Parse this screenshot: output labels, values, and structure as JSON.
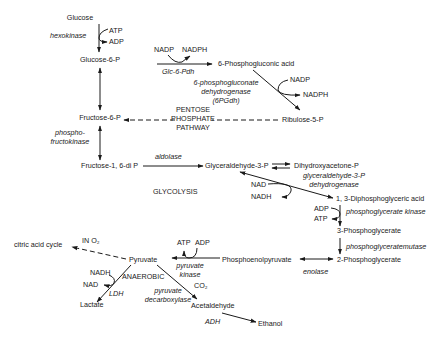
{
  "metabolites": {
    "glucose": "Glucose",
    "glucose_6p": "Glucose-6-P",
    "fructose_6p": "Fructose-6-P",
    "fructose_16dip": "Fructose-1, 6-di P",
    "glyceraldehyde_3p": "Glyceraldehyde-3-P",
    "dihydroxyacetone_p": "Dihydroxyacetone-P",
    "diphosphoglyceric": "1, 3-Diphosphoglyceric acid",
    "phosphoglycerate_3": "3-Phosphoglycerate",
    "phosphoglycerate_2": "2-Phosphoglycerate",
    "pep": "Phosphoenolpyruvate",
    "pyruvate": "Pyruvate",
    "lactate": "Lactate",
    "acetaldehyde": "Acetaldehyde",
    "ethanol": "Ethanol",
    "phosphogluconic": "6-Phosphogluconic acid",
    "ribulose_5p": "Ribulose-5-P",
    "citric_acid_cycle": "citric acid cycle"
  },
  "enzymes": {
    "hexokinase": "hexokinase",
    "pfk_1": "phospho-",
    "pfk_2": "fructokinase",
    "aldolase": "aldolase",
    "gapdh_1": "glyceraldehyde-3-P",
    "gapdh_2": "dehydrogenase",
    "pgk": "phosphoglycerate kinase",
    "pgm": "phosphoglyceratemutase",
    "enolase": "enolase",
    "pk_1": "pyruvate",
    "pk_2": "kinase",
    "ldh": "LDH",
    "pdc_1": "pyruvate",
    "pdc_2": "decarboxylase",
    "adh": "ADH",
    "g6pdh": "Glc-6-Pdh",
    "pgdh_1": "6-phosphogluconate",
    "pgdh_2": "dehydrogenase",
    "pgdh_3": "(6PGdh)"
  },
  "cofactors": {
    "atp": "ATP",
    "adp": "ADP",
    "nadp": "NADP",
    "nadph": "NADPH",
    "nad": "NAD",
    "nadh": "NADH",
    "co2": "CO₂"
  },
  "labels": {
    "pentose_1": "PENTOSE",
    "pentose_2": "PHOSPHATE",
    "pentose_3": "PATHWAY",
    "glycolysis": "GLYCOLYSIS",
    "anaerobic": "ANAEROBIC",
    "in_o2": "IN O₂"
  },
  "colors": {
    "ink": "#1a1a1a",
    "background": "#ffffff"
  }
}
